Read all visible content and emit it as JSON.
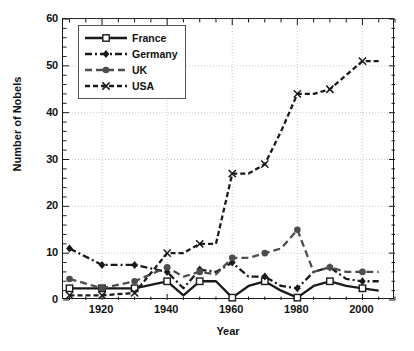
{
  "chart_data": {
    "type": "line",
    "title": "",
    "xlabel": "Year",
    "ylabel": "Number of Nobels",
    "xlim": [
      1908,
      2010
    ],
    "ylim": [
      0,
      60
    ],
    "xticks": [
      1920,
      1940,
      1960,
      1980,
      2000
    ],
    "yticks": [
      0,
      10,
      20,
      30,
      40,
      50,
      60
    ],
    "x_minor_step": 5,
    "y_minor_step": 2,
    "grid": "dotted-both",
    "legend_position": "top-left-inside",
    "x": [
      1910,
      1920,
      1930,
      1940,
      1945,
      1950,
      1955,
      1960,
      1965,
      1970,
      1975,
      1980,
      1985,
      1990,
      1995,
      2000,
      2005
    ],
    "series": [
      {
        "name": "France",
        "color": "#1a1a1a",
        "marker": "open-square",
        "dash": "solid",
        "values": [
          2.5,
          2.5,
          2.5,
          4,
          1,
          4,
          4,
          0.5,
          3,
          4,
          2,
          0.5,
          3,
          4,
          3,
          2.5,
          2
        ]
      },
      {
        "name": "Germany",
        "color": "#1a1a1a",
        "marker": "filled-diamond",
        "dash": "dash-dot",
        "values": [
          11,
          7.5,
          7.5,
          6,
          2.5,
          6.5,
          6,
          8,
          5,
          5,
          3,
          2.5,
          6,
          7,
          4.5,
          4,
          4
        ]
      },
      {
        "name": "UK",
        "color": "#4d4d4d",
        "marker": "filled-circle",
        "dash": "long-dash",
        "values": [
          4.5,
          2.5,
          4,
          7,
          5,
          6,
          5.5,
          9,
          9,
          10,
          11,
          15,
          6,
          7,
          6,
          6,
          6
        ]
      },
      {
        "name": "USA",
        "color": "#1a1a1a",
        "marker": "x-cross",
        "dash": "dashed",
        "values": [
          1,
          1,
          1.5,
          10,
          10,
          12,
          12,
          27,
          27,
          29,
          36,
          44,
          44,
          45,
          48,
          51,
          51
        ]
      }
    ]
  },
  "legend": {
    "entries": [
      {
        "label": "France"
      },
      {
        "label": "Germany"
      },
      {
        "label": "UK"
      },
      {
        "label": "USA"
      }
    ]
  },
  "axes": {
    "x_title": "Year",
    "y_title": "Number of Nobels",
    "x_tick_labels": [
      "1920",
      "1940",
      "1960",
      "1980",
      "2000"
    ],
    "y_tick_labels": [
      "0",
      "10",
      "20",
      "30",
      "40",
      "50",
      "60"
    ]
  }
}
